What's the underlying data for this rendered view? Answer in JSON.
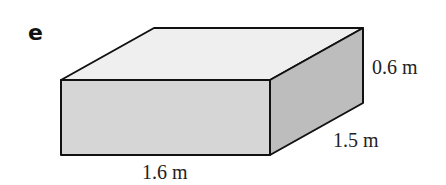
{
  "figure": {
    "part_label": "e",
    "shape": "cuboid",
    "dimensions": {
      "width": "1.6 m",
      "depth": "1.5 m",
      "height": "0.6 m"
    },
    "colors": {
      "top_face": "#efefef",
      "front_face": "#d6d6d6",
      "side_face": "#bdbdbd",
      "edges": "#111111"
    }
  }
}
